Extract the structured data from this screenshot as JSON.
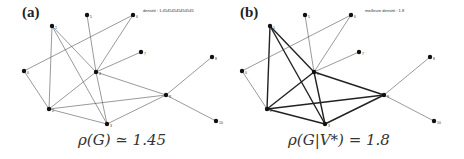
{
  "panels": [
    {
      "letter": "(a)",
      "annotation": "densité : 1.45454545454545",
      "caption_lhs": "ρ(G) ≃ 1.45",
      "highlighted_nodes": []
    },
    {
      "letter": "(b)",
      "annotation": "meilleure densité : 1.8",
      "caption_lhs": "ρ(G|V*) = 1.8",
      "highlighted_nodes": [
        "1",
        "2",
        "3",
        "4",
        "9"
      ]
    }
  ],
  "graph": {
    "nodes": [
      {
        "id": "0",
        "x": 24,
        "y": 71
      },
      {
        "id": "1",
        "x": 52,
        "y": 26
      },
      {
        "id": "2",
        "x": 49,
        "y": 109
      },
      {
        "id": "3",
        "x": 107,
        "y": 124
      },
      {
        "id": "4",
        "x": 96,
        "y": 72
      },
      {
        "id": "5",
        "x": 87,
        "y": 15
      },
      {
        "id": "6",
        "x": 133,
        "y": 15
      },
      {
        "id": "7",
        "x": 141,
        "y": 52
      },
      {
        "id": "8",
        "x": 212,
        "y": 57
      },
      {
        "id": "9",
        "x": 166,
        "y": 95
      },
      {
        "id": "10",
        "x": 216,
        "y": 121
      }
    ],
    "edges": [
      [
        "1",
        "2"
      ],
      [
        "1",
        "3"
      ],
      [
        "1",
        "4"
      ],
      [
        "0",
        "6"
      ],
      [
        "0",
        "2"
      ],
      [
        "5",
        "4"
      ],
      [
        "6",
        "4"
      ],
      [
        "7",
        "4"
      ],
      [
        "4",
        "2"
      ],
      [
        "4",
        "3"
      ],
      [
        "4",
        "9"
      ],
      [
        "2",
        "9"
      ],
      [
        "2",
        "3"
      ],
      [
        "3",
        "9"
      ],
      [
        "9",
        "8"
      ],
      [
        "9",
        "10"
      ]
    ]
  },
  "colors": {
    "edge": "#555555",
    "edge_bold": "#222222",
    "node": "#111111"
  }
}
